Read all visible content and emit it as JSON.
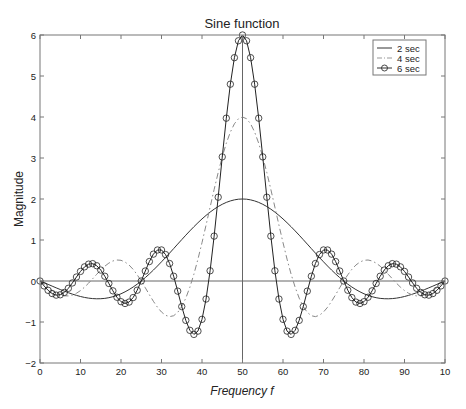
{
  "chart_data": {
    "type": "line",
    "title": "Sine function",
    "xlabel": "Frequency f",
    "ylabel": "Magnitude",
    "xlim": [
      0,
      100
    ],
    "ylim": [
      -2,
      6
    ],
    "grid": false,
    "legend_position": "upper right",
    "x_ticks": [
      0,
      10,
      20,
      30,
      40,
      50,
      60,
      70,
      80,
      90,
      100
    ],
    "x_tick_labels": [
      "0",
      "10",
      "20",
      "30",
      "40",
      "50",
      "60",
      "70",
      "80",
      "90",
      "10"
    ],
    "y_ticks": [
      -2,
      -1,
      0,
      1,
      2,
      3,
      4,
      5,
      6
    ],
    "y_tick_labels": [
      "−2",
      "−1",
      "0",
      "1",
      "2",
      "3",
      "4",
      "5",
      "6"
    ],
    "reference_lines": {
      "horizontal_y": 0,
      "vertical_x": 50
    },
    "x": [
      0,
      1,
      2,
      3,
      4,
      5,
      6,
      7,
      8,
      9,
      10,
      11,
      12,
      13,
      14,
      15,
      16,
      17,
      18,
      19,
      20,
      21,
      22,
      23,
      24,
      25,
      26,
      27,
      28,
      29,
      30,
      31,
      32,
      33,
      34,
      35,
      36,
      37,
      38,
      39,
      40,
      41,
      42,
      43,
      44,
      45,
      46,
      47,
      48,
      49,
      50,
      51,
      52,
      53,
      54,
      55,
      56,
      57,
      58,
      59,
      60,
      61,
      62,
      63,
      64,
      65,
      66,
      67,
      68,
      69,
      70,
      71,
      72,
      73,
      74,
      75,
      76,
      77,
      78,
      79,
      80,
      81,
      82,
      83,
      84,
      85,
      86,
      87,
      88,
      89,
      90,
      91,
      92,
      93,
      94,
      95,
      96,
      97,
      98,
      99,
      100
    ],
    "series": [
      {
        "name": "2 sec",
        "style": "solid",
        "marker": "none",
        "color": "#333333",
        "values": [
          0,
          -0.041,
          -0.082,
          -0.125,
          -0.167,
          -0.208,
          -0.248,
          -0.285,
          -0.32,
          -0.351,
          -0.378,
          -0.401,
          -0.418,
          -0.429,
          -0.434,
          -0.432,
          -0.424,
          -0.407,
          -0.383,
          -0.351,
          -0.312,
          -0.264,
          -0.209,
          -0.147,
          -0.077,
          0,
          0.083,
          0.172,
          0.266,
          0.365,
          0.468,
          0.573,
          0.681,
          0.79,
          0.9,
          1.009,
          1.117,
          1.222,
          1.324,
          1.421,
          1.514,
          1.6,
          1.68,
          1.752,
          1.816,
          1.871,
          1.917,
          1.953,
          1.979,
          1.995,
          2,
          1.995,
          1.979,
          1.953,
          1.917,
          1.871,
          1.816,
          1.752,
          1.68,
          1.6,
          1.514,
          1.421,
          1.324,
          1.222,
          1.117,
          1.009,
          0.9,
          0.79,
          0.681,
          0.573,
          0.468,
          0.365,
          0.266,
          0.172,
          0.083,
          0,
          -0.077,
          -0.147,
          -0.209,
          -0.264,
          -0.312,
          -0.351,
          -0.383,
          -0.407,
          -0.424,
          -0.432,
          -0.434,
          -0.429,
          -0.418,
          -0.401,
          -0.378,
          -0.351,
          -0.32,
          -0.285,
          -0.248,
          -0.208,
          -0.167,
          -0.125,
          -0.082,
          -0.041,
          0
        ]
      },
      {
        "name": "4 sec",
        "style": "dashdot",
        "marker": "none",
        "color": "#888888",
        "values": [
          0,
          -0.081,
          -0.16,
          -0.232,
          -0.292,
          -0.336,
          -0.361,
          -0.364,
          -0.343,
          -0.299,
          -0.234,
          -0.15,
          -0.052,
          0.054,
          0.163,
          0.267,
          0.361,
          0.436,
          0.489,
          0.512,
          0.505,
          0.463,
          0.389,
          0.284,
          0.152,
          0,
          -0.165,
          -0.333,
          -0.495,
          -0.64,
          -0.757,
          -0.836,
          -0.869,
          -0.847,
          -0.766,
          -0.624,
          -0.418,
          -0.153,
          0.166,
          0.533,
          0.935,
          1.363,
          1.8,
          2.233,
          2.647,
          3.027,
          3.359,
          3.632,
          3.834,
          3.958,
          4,
          3.958,
          3.834,
          3.632,
          3.359,
          3.027,
          2.647,
          2.233,
          1.8,
          1.363,
          0.935,
          0.533,
          0.166,
          -0.153,
          -0.418,
          -0.624,
          -0.766,
          -0.847,
          -0.869,
          -0.836,
          -0.757,
          -0.64,
          -0.495,
          -0.333,
          -0.165,
          0,
          0.152,
          0.284,
          0.389,
          0.463,
          0.505,
          0.512,
          0.489,
          0.436,
          0.361,
          0.267,
          0.163,
          0.054,
          -0.052,
          -0.15,
          -0.234,
          -0.299,
          -0.343,
          -0.364,
          -0.361,
          -0.336,
          -0.292,
          -0.232,
          -0.16,
          -0.081,
          0
        ]
      },
      {
        "name": "6 sec",
        "style": "solid",
        "marker": "circle",
        "color": "#222222",
        "values": [
          0,
          -0.12,
          -0.227,
          -0.306,
          -0.345,
          -0.336,
          -0.279,
          -0.178,
          -0.047,
          0.097,
          0.234,
          0.345,
          0.411,
          0.423,
          0.373,
          0.267,
          0.116,
          -0.06,
          -0.24,
          -0.396,
          -0.505,
          -0.548,
          -0.514,
          -0.404,
          -0.225,
          0,
          0.244,
          0.474,
          0.655,
          0.756,
          0.757,
          0.645,
          0.426,
          0.117,
          -0.247,
          -0.624,
          -0.96,
          -1.203,
          -1.303,
          -1.222,
          -0.935,
          -0.44,
          0.249,
          1.095,
          2.044,
          3.027,
          3.971,
          4.8,
          5.447,
          5.859,
          6,
          5.859,
          5.447,
          4.8,
          3.971,
          3.027,
          2.044,
          1.095,
          0.249,
          -0.44,
          -0.935,
          -1.222,
          -1.303,
          -1.203,
          -0.96,
          -0.624,
          -0.247,
          0.117,
          0.426,
          0.645,
          0.757,
          0.756,
          0.655,
          0.474,
          0.244,
          0,
          -0.225,
          -0.404,
          -0.514,
          -0.548,
          -0.505,
          -0.396,
          -0.24,
          -0.06,
          0.116,
          0.267,
          0.373,
          0.423,
          0.411,
          0.345,
          0.234,
          0.097,
          -0.047,
          -0.178,
          -0.279,
          -0.336,
          -0.345,
          -0.306,
          -0.227,
          -0.12,
          0
        ]
      }
    ]
  }
}
